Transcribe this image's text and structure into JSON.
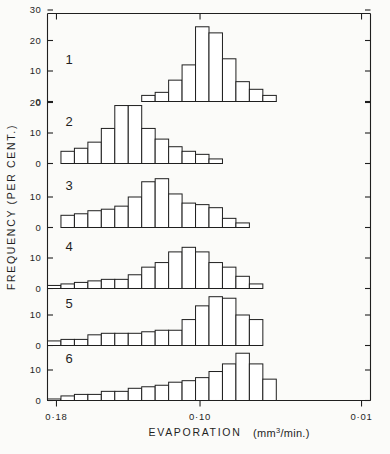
{
  "figure": {
    "background": "#fbfbf9",
    "ink": "#1f1f1f",
    "x_axis_label": "EVAPORATION",
    "x_axis_units": "(mm",
    "x_axis_units_sup": "3",
    "x_axis_units_tail": "/min.)",
    "y_axis_label": "FREQUENCY  (PER CENT.)",
    "x_ticks": [
      "0·18",
      "0·10",
      "0·01"
    ],
    "panel_labels": [
      "1",
      "2",
      "3",
      "4",
      "5",
      "6"
    ],
    "y_ticks_panel1": [
      "0",
      "10",
      "20",
      "30"
    ],
    "y_ticks_panel2": [
      "0",
      "10",
      "20"
    ],
    "y_ticks_other": [
      "0",
      "10"
    ]
  },
  "chart_data": {
    "type": "bar",
    "title": "",
    "subtitle": "",
    "xlabel": "EVAPORATION  (mm3/min.)",
    "ylabel": "FREQUENCY  (PER CENT.)",
    "grid": false,
    "legend": "none",
    "axis_note": "x axis is reversed: 0.18 at left, 0.01 at right; six stacked histogram panels share one x axis",
    "x_tick_values": [
      0.18,
      0.1,
      0.01
    ],
    "x_tick_labels": [
      "0·18",
      "0·10",
      "0·01"
    ],
    "panels": [
      {
        "name": "1",
        "ylim": [
          0,
          30
        ],
        "yticks": [
          0,
          10,
          20,
          30
        ],
        "bin_start_index": 7,
        "bin_width_units": 1,
        "values": [
          2,
          3,
          7,
          12,
          24.5,
          22.5,
          14,
          6.5,
          4,
          2
        ]
      },
      {
        "name": "2",
        "ylim": [
          0,
          20
        ],
        "yticks": [
          0,
          10,
          20
        ],
        "bin_start_index": 1,
        "bin_width_units": 1,
        "values": [
          4,
          5,
          7,
          11.5,
          19,
          19,
          11.5,
          8,
          5.5,
          4,
          3,
          1.5
        ]
      },
      {
        "name": "3",
        "ylim": [
          0,
          20
        ],
        "yticks": [
          0,
          10
        ],
        "bin_start_index": 1,
        "bin_width_units": 1,
        "values": [
          4,
          4.5,
          5.5,
          6,
          7,
          10,
          15,
          16,
          11,
          8,
          7.5,
          6.5,
          3,
          1.5
        ]
      },
      {
        "name": "4",
        "ylim": [
          0,
          20
        ],
        "yticks": [
          0,
          10
        ],
        "bin_start_index": 0,
        "bin_width_units": 1,
        "values": [
          1,
          1.5,
          2,
          2.5,
          3,
          3,
          4.5,
          7,
          8.5,
          12,
          13.5,
          12,
          8.5,
          7,
          4,
          1.5
        ]
      },
      {
        "name": "5",
        "ylim": [
          0,
          20
        ],
        "yticks": [
          0,
          10
        ],
        "bin_start_index": 0,
        "bin_width_units": 1,
        "values": [
          1.5,
          2,
          2,
          3.5,
          4,
          4,
          4,
          4.5,
          5,
          5,
          8.5,
          13,
          16,
          15.5,
          10,
          8.5
        ]
      },
      {
        "name": "6",
        "ylim": [
          0,
          20
        ],
        "yticks": [
          0,
          10
        ],
        "bin_start_index": 0,
        "bin_width_units": 1,
        "values": [
          0.5,
          1.5,
          2,
          2,
          3,
          3,
          4,
          4.5,
          5,
          6,
          6.5,
          7.5,
          9.5,
          12,
          15.5,
          12,
          7
        ]
      }
    ]
  }
}
